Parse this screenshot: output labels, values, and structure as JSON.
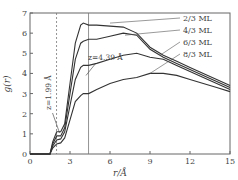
{
  "chart_data": {
    "type": "line",
    "title": "",
    "xlabel": "r/Å",
    "ylabel": "g(r)",
    "xlim": [
      0,
      15
    ],
    "ylim": [
      0,
      7
    ],
    "xticks": [
      0,
      3,
      6,
      9,
      12,
      15
    ],
    "yticks": [
      0,
      1,
      2,
      3,
      4,
      5,
      6,
      7
    ],
    "grid": false,
    "legend_position": "upper right (arrow-labeled)",
    "annotations": [
      {
        "text": "z=1.99 Å",
        "x": 1.99,
        "type": "vertical dashed line"
      },
      {
        "text": "z=4.39 Å",
        "x": 4.39,
        "type": "vertical solid line"
      }
    ],
    "x": [
      0,
      1.5,
      1.7,
      2.0,
      2.3,
      2.6,
      3.0,
      3.4,
      3.8,
      4.0,
      4.4,
      5,
      6,
      7,
      8,
      9,
      10,
      11,
      12,
      13,
      14,
      15
    ],
    "series": [
      {
        "name": "2/3 ML",
        "values": [
          0,
          0,
          0.6,
          1.1,
          1.1,
          1.5,
          3.5,
          5.5,
          6.4,
          6.5,
          6.4,
          6.4,
          6.35,
          6.3,
          6.0,
          5.3,
          4.9,
          4.6,
          4.3,
          4.0,
          3.7,
          3.4
        ]
      },
      {
        "name": "4/3 ML",
        "values": [
          0,
          0,
          0.5,
          0.9,
          0.9,
          1.3,
          3.0,
          4.7,
          5.5,
          5.6,
          5.7,
          5.7,
          5.85,
          6.0,
          5.9,
          5.2,
          4.8,
          4.5,
          4.2,
          3.9,
          3.6,
          3.3
        ]
      },
      {
        "name": "6/3 ML",
        "values": [
          0,
          0,
          0.4,
          0.7,
          0.75,
          1.1,
          2.4,
          3.7,
          4.3,
          4.4,
          4.4,
          4.5,
          4.7,
          4.9,
          5.0,
          4.8,
          4.7,
          4.4,
          4.1,
          3.8,
          3.5,
          3.2
        ]
      },
      {
        "name": "8/3 ML",
        "values": [
          0,
          0,
          0.3,
          0.5,
          0.55,
          0.8,
          1.7,
          2.6,
          2.9,
          3.0,
          3.0,
          3.2,
          3.5,
          3.7,
          3.8,
          4.0,
          4.0,
          3.9,
          3.7,
          3.5,
          3.3,
          3.1
        ]
      }
    ]
  }
}
